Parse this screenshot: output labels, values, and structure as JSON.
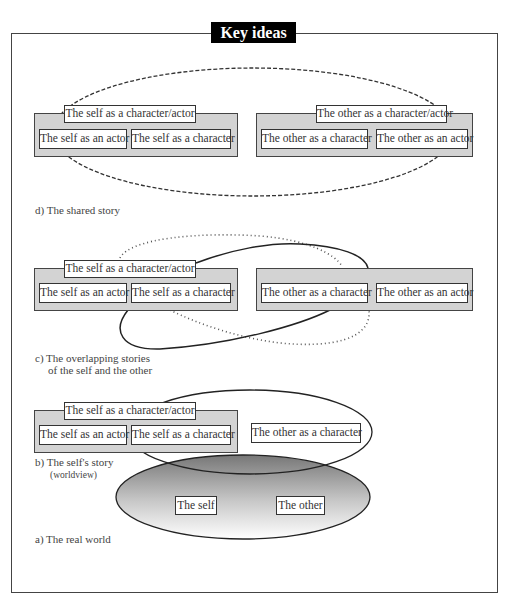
{
  "title": "Key ideas",
  "panels": {
    "d": {
      "caption": "d) The shared story",
      "self_group": {
        "title": "The self as a character/actor",
        "items": [
          "The self as an actor",
          "The self as a character"
        ]
      },
      "other_group": {
        "title": "The other as a character/actor",
        "items": [
          "The other as a character",
          "The other as an actor"
        ]
      },
      "outline_style": "dashed"
    },
    "c": {
      "caption_line1": "c) The overlapping stories",
      "caption_line2": "of the self and the other",
      "self_group": {
        "title": "The self as a character/actor",
        "items": [
          "The self as an actor",
          "The self as a character"
        ]
      },
      "other_group": {
        "items": [
          "The other as a character",
          "The other as an actor"
        ]
      },
      "outline_styles": [
        "solid",
        "dotted"
      ]
    },
    "b": {
      "caption_line1": "b) The self's story",
      "caption_line2": "(worldview)",
      "self_group": {
        "title": "The self as a character/actor",
        "items": [
          "The self as an actor",
          "The self as a character"
        ]
      },
      "other_item": "The other as a character"
    },
    "a": {
      "caption": "a) The real world",
      "items": [
        "The self",
        "The other"
      ]
    }
  },
  "colors": {
    "group_fill": "#d3d3d3",
    "outline": "#333333",
    "title_bg": "#000000",
    "title_fg": "#ffffff",
    "world_gradient_top": "#7a7a7a",
    "world_gradient_bottom": "#ffffff"
  }
}
